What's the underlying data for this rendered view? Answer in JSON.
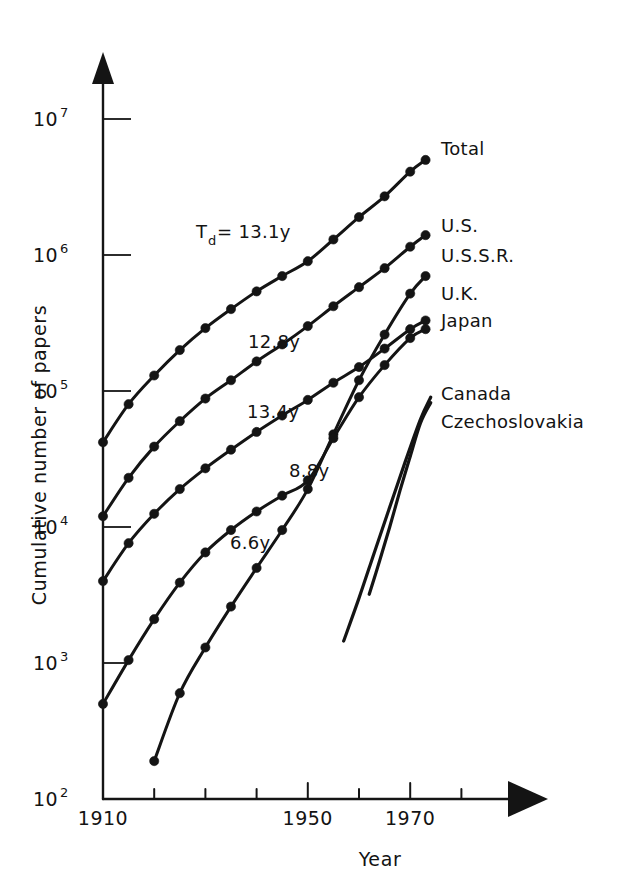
{
  "figure": {
    "domain_kind": "chart",
    "background_color": "#ffffff",
    "ink_color": "#141414"
  },
  "axes": {
    "x": {
      "title": "Year",
      "tick_labels_shown": [
        "1910",
        "1950",
        "1970"
      ],
      "tick_years": [
        1910,
        1920,
        1930,
        1940,
        1950,
        1960,
        1970,
        1980
      ],
      "range": [
        1910,
        1984
      ],
      "arrow": true
    },
    "y": {
      "title": "Cumulative number of papers",
      "scale": "log10",
      "tick_labels_shown": [
        "10",
        "10",
        "10",
        "10",
        "10",
        "10"
      ],
      "tick_exponents": [
        "2",
        "3",
        "4",
        "5",
        "6",
        "7"
      ],
      "tick_values": [
        100,
        1000,
        10000,
        100000,
        1000000,
        10000000
      ],
      "range": [
        100,
        10000000
      ],
      "arrow": true
    }
  },
  "annotations": [
    {
      "id": "td-total",
      "base": "T",
      "sub": "d",
      "text": " = 13.1y",
      "x": 196,
      "y": 238
    },
    {
      "id": "td-us",
      "base": "",
      "sub": "",
      "text": "12.8y",
      "x": 248,
      "y": 348
    },
    {
      "id": "td-uk",
      "base": "",
      "sub": "",
      "text": "13.4y",
      "x": 247,
      "y": 418
    },
    {
      "id": "td-ussr",
      "base": "",
      "sub": "",
      "text": "8.8y",
      "x": 289,
      "y": 477
    },
    {
      "id": "td-japan",
      "base": "",
      "sub": "",
      "text": "6.6y",
      "x": 230,
      "y": 549
    }
  ],
  "series_labels": [
    {
      "name": "Total",
      "x": 441,
      "y": 155
    },
    {
      "name": "U.S.",
      "x": 441,
      "y": 232
    },
    {
      "name": "U.S.S.R.",
      "x": 441,
      "y": 262
    },
    {
      "name": "U.K.",
      "x": 441,
      "y": 300
    },
    {
      "name": "Japan",
      "x": 441,
      "y": 327
    },
    {
      "name": "Canada",
      "x": 441,
      "y": 400
    },
    {
      "name": "Czechoslovakia",
      "x": 441,
      "y": 428
    }
  ],
  "chart_data": {
    "type": "line",
    "title": "",
    "subtitle": "",
    "xlabel": "Year",
    "ylabel": "Cumulative number of papers",
    "xlim": [
      1910,
      1984
    ],
    "ylim": [
      100,
      10000000
    ],
    "yscale": "log",
    "grid": false,
    "legend": "inline-right-end-of-curve",
    "markers": "filled circles on every 5-year datum",
    "doubling_times_years": {
      "Total": 13.1,
      "U.S.": 12.8,
      "U.K.": 13.4,
      "U.S.S.R.": 8.8,
      "Japan": 6.6
    },
    "series": [
      {
        "name": "Total",
        "doubling_time_label": "Td = 13.1y",
        "has_markers": true,
        "x": [
          1910,
          1915,
          1920,
          1925,
          1930,
          1935,
          1940,
          1945,
          1950,
          1955,
          1960,
          1965,
          1970,
          1973
        ],
        "values": [
          42000,
          80000,
          130000,
          200000,
          290000,
          400000,
          540000,
          700000,
          900000,
          1300000,
          1900000,
          2700000,
          4100000,
          5000000
        ]
      },
      {
        "name": "U.S.",
        "doubling_time_label": "12.8y",
        "has_markers": true,
        "x": [
          1910,
          1915,
          1920,
          1925,
          1930,
          1935,
          1940,
          1945,
          1950,
          1955,
          1960,
          1965,
          1970,
          1973
        ],
        "values": [
          12000,
          23000,
          39000,
          60000,
          88000,
          120000,
          165000,
          220000,
          300000,
          420000,
          580000,
          800000,
          1150000,
          1400000
        ]
      },
      {
        "name": "U.S.S.R.",
        "doubling_time_label": "8.8y",
        "has_markers": true,
        "x": [
          1920,
          1925,
          1930,
          1935,
          1940,
          1945,
          1950,
          1955,
          1960,
          1965,
          1970,
          1973
        ],
        "values": [
          190,
          600,
          1300,
          2600,
          5000,
          9500,
          19000,
          48000,
          120000,
          260000,
          520000,
          700000
        ]
      },
      {
        "name": "U.K.",
        "doubling_time_label": "13.4y",
        "has_markers": true,
        "x": [
          1910,
          1915,
          1920,
          1925,
          1930,
          1935,
          1940,
          1945,
          1950,
          1955,
          1960,
          1965,
          1970,
          1973
        ],
        "values": [
          4000,
          7600,
          12500,
          19000,
          27000,
          37000,
          50000,
          66000,
          86000,
          115000,
          150000,
          205000,
          285000,
          330000
        ]
      },
      {
        "name": "Japan",
        "doubling_time_label": "6.6y",
        "has_markers": true,
        "x": [
          1910,
          1915,
          1920,
          1925,
          1930,
          1935,
          1940,
          1945,
          1950,
          1955,
          1960,
          1965,
          1970,
          1973
        ],
        "values": [
          500,
          1050,
          2100,
          3900,
          6500,
          9500,
          13000,
          17000,
          22000,
          45000,
          90000,
          155000,
          245000,
          285000
        ]
      },
      {
        "name": "Canada",
        "doubling_time_label": "",
        "has_markers": false,
        "x": [
          1957,
          1960,
          1963,
          1966,
          1969,
          1972,
          1974
        ],
        "values": [
          1450,
          3000,
          6500,
          14000,
          30000,
          62000,
          90000
        ]
      },
      {
        "name": "Czechoslovakia",
        "doubling_time_label": "",
        "has_markers": false,
        "x": [
          1962,
          1964,
          1966,
          1968,
          1970,
          1972,
          1974
        ],
        "values": [
          3200,
          5600,
          10000,
          18500,
          33000,
          58000,
          82000
        ]
      }
    ]
  }
}
